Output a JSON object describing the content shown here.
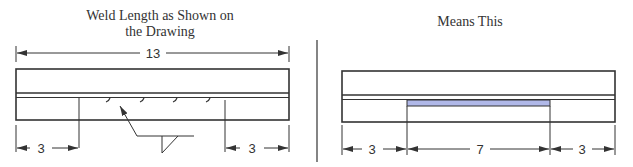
{
  "left_panel": {
    "title_line1": "Weld Length as Shown on",
    "title_line2": "the Drawing",
    "overall_dimension": "13",
    "left_offset_dimension": "3",
    "right_offset_dimension": "3",
    "weld_symbol": "fillet-weld-symbol"
  },
  "right_panel": {
    "title": "Means This",
    "left_offset_dimension": "3",
    "weld_length_dimension": "7",
    "right_offset_dimension": "3",
    "weld_color": "#b0b8e8"
  },
  "colors": {
    "line": "#333333",
    "weld_fill": "#b0b8e8"
  }
}
